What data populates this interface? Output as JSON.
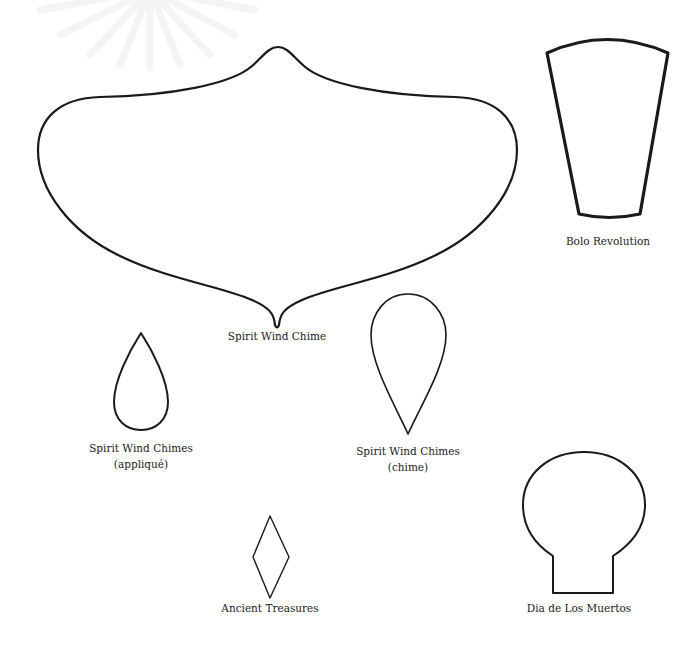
{
  "page": {
    "background": "#ffffff",
    "stroke_color": "#1a1a1a",
    "label_color": "#222222"
  },
  "watermark": {
    "icon": "sunburst-watermark-icon",
    "opacity": "very faint"
  },
  "templates": [
    {
      "id": "spirit-wind-chime",
      "shape": "ornament-body",
      "label": "Spirit Wind Chime"
    },
    {
      "id": "bolo-revolution",
      "shape": "tapered-trapezoid",
      "label": "Bolo Revolution"
    },
    {
      "id": "spirit-wind-chimes-applique",
      "shape": "teardrop-point-up",
      "label_line1": "Spirit Wind Chimes",
      "label_line2": "(appliqué)"
    },
    {
      "id": "spirit-wind-chimes-chime",
      "shape": "teardrop-point-down",
      "label_line1": "Spirit Wind Chimes",
      "label_line2": "(chime)"
    },
    {
      "id": "ancient-treasures",
      "shape": "diamond",
      "label": "Ancient Treasures"
    },
    {
      "id": "dia-de-los-muertos",
      "shape": "skull",
      "label": "Dia de Los Muertos"
    }
  ]
}
